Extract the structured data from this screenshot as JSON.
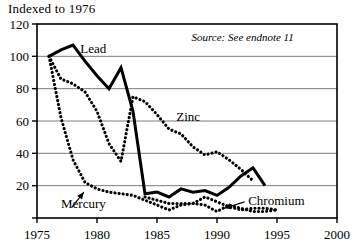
{
  "chart_data": {
    "type": "line",
    "title": "Indexed to 1976",
    "xlabel": "",
    "ylabel": "",
    "xlim": [
      1975,
      2000
    ],
    "ylim": [
      0,
      120
    ],
    "xticks": [
      1975,
      1980,
      1985,
      1990,
      1995,
      2000
    ],
    "yticks": [
      0,
      20,
      40,
      60,
      80,
      100,
      120
    ],
    "ytick_labels": [
      "",
      "20",
      "40",
      "60",
      "80",
      "100",
      "120"
    ],
    "grid": true,
    "legend": "inline-annotations",
    "annotations": [
      {
        "text": "Source: See endnote 11",
        "style": "italic",
        "x": 1996.4,
        "y": 112,
        "anchor": "end"
      }
    ],
    "series": [
      {
        "name": "Lead",
        "style": "solid",
        "label_x": 1978.6,
        "label_y": 105,
        "x": [
          1976,
          1977,
          1978,
          1979,
          1980,
          1981,
          1982,
          1983,
          1984,
          1985,
          1986,
          1987,
          1988,
          1989,
          1990,
          1991,
          1992,
          1993,
          1994
        ],
        "values": [
          100,
          104,
          107,
          97,
          88,
          80,
          93,
          66,
          15,
          16,
          13,
          18,
          16,
          17,
          14,
          19,
          26,
          31,
          20
        ]
      },
      {
        "name": "Mercury",
        "style": "dotted",
        "label_x": 1977.0,
        "label_y": 9,
        "arrow": {
          "from_x": 1977.9,
          "from_y": 6.5,
          "to_x": 1978.9,
          "to_y": 16
        },
        "x": [
          1976,
          1977,
          1978,
          1979,
          1980,
          1981,
          1982,
          1983,
          1984,
          1985,
          1986,
          1987,
          1988,
          1989,
          1990,
          1991,
          1992,
          1993,
          1994,
          1995
        ],
        "values": [
          100,
          62,
          36,
          22,
          18,
          16,
          15,
          14,
          11,
          8,
          5,
          8,
          9,
          8,
          4,
          8,
          6,
          4,
          4,
          5
        ]
      },
      {
        "name": "Zinc",
        "style": "dotted",
        "label_x": 1986.6,
        "label_y": 63,
        "x": [
          1976,
          1977,
          1978,
          1979,
          1980,
          1981,
          1982,
          1983,
          1984,
          1985,
          1986,
          1987,
          1988,
          1989,
          1990,
          1991,
          1992,
          1993
        ],
        "values": [
          100,
          86,
          83,
          78,
          66,
          46,
          35,
          75,
          72,
          64,
          55,
          52,
          44,
          39,
          41,
          36,
          30,
          23
        ]
      },
      {
        "name": "Chromium",
        "style": "dotted",
        "label_x": 1992.6,
        "label_y": 11,
        "arrow": {
          "from_x": 1992.3,
          "from_y": 10,
          "to_x": 1990.6,
          "to_y": 6
        },
        "x": [
          1984,
          1985,
          1986,
          1987,
          1988,
          1989,
          1990,
          1991,
          1992,
          1993,
          1994,
          1995
        ],
        "values": [
          13,
          11,
          9,
          9,
          9,
          13,
          10,
          7,
          5,
          6,
          6,
          5
        ]
      }
    ]
  }
}
